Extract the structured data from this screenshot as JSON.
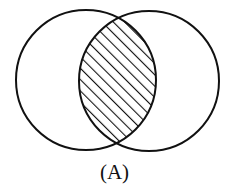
{
  "diagram": {
    "type": "venn",
    "caption": "(A)",
    "sets": [
      {
        "name": "left-circle",
        "cx": 86,
        "cy": 80,
        "r": 70
      },
      {
        "name": "right-circle",
        "cx": 149,
        "cy": 81,
        "r": 70
      }
    ],
    "shaded_region": "intersection",
    "shading": "diagonal-hatch",
    "stroke_color": "#111111",
    "background": "#ffffff"
  }
}
